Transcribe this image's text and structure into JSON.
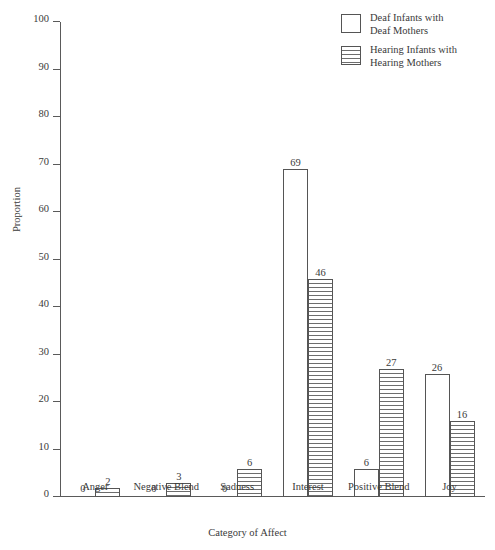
{
  "chart_data": {
    "type": "bar",
    "title": "",
    "xlabel": "Category of Affect",
    "ylabel": "Proportion",
    "ylim": [
      0,
      100
    ],
    "ytick_step": 10,
    "yticks": [
      0,
      10,
      20,
      30,
      40,
      50,
      60,
      70,
      80,
      90,
      100
    ],
    "grid": false,
    "legend_position": "top-right",
    "categories": [
      "Anger",
      "Negative Blend",
      "Sadness",
      "Interest",
      "Positive Blend",
      "Joy"
    ],
    "series": [
      {
        "name": "Deaf Infants with Deaf Mothers",
        "fill": "white",
        "values": [
          0,
          0,
          0,
          69,
          6,
          26
        ]
      },
      {
        "name": "Hearing Infants with Hearing Mothers",
        "fill": "horizontal-hatch",
        "values": [
          2,
          3,
          6,
          46,
          27,
          16
        ]
      }
    ]
  },
  "legend": {
    "items": [
      {
        "label_line1": "Deaf Infants with",
        "label_line2": "Deaf Mothers",
        "swatch": "white"
      },
      {
        "label_line1": "Hearing Infants with",
        "label_line2": "Hearing Mothers",
        "swatch": "hatched"
      }
    ]
  },
  "colors": {
    "axis": "#5a5a5a",
    "text": "#3a3a3a",
    "hatch": "#6d6d6d",
    "background": "#ffffff"
  }
}
